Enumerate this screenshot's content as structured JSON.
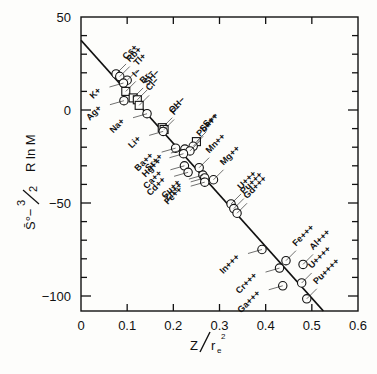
{
  "chart_data": {
    "type": "scatter",
    "title": "",
    "xlabel": "Z / r_e^2",
    "ylabel": "S° − 3/2 R ln M",
    "xlim": [
      0,
      0.6
    ],
    "ylim": [
      -110,
      50
    ],
    "x_ticks": [
      "0",
      "0.1",
      "0.2",
      "0.3",
      "0.4",
      "0.5",
      "0.6"
    ],
    "y_ticks": [
      "50",
      "0",
      "-50",
      "-100"
    ],
    "grid": false,
    "legend": "none",
    "markers": {
      "cation": "circle",
      "anion": "square"
    },
    "fit_line": {
      "x": [
        0,
        0.525
      ],
      "y": [
        37.5,
        -111
      ]
    },
    "points": [
      {
        "label": "Cs+",
        "x": 0.076,
        "y": 19.4,
        "marker": "circle"
      },
      {
        "label": "Rb+",
        "x": 0.084,
        "y": 18.0,
        "marker": "circle"
      },
      {
        "label": "Tl+",
        "x": 0.1,
        "y": 16.0,
        "marker": "circle"
      },
      {
        "label": "K+",
        "x": 0.092,
        "y": 14.5,
        "marker": "circle"
      },
      {
        "label": "I−",
        "x": 0.097,
        "y": 10.0,
        "marker": "square"
      },
      {
        "label": "Br−",
        "x": 0.113,
        "y": 6.5,
        "marker": "square"
      },
      {
        "label": "SH−",
        "x": 0.122,
        "y": 5.5,
        "marker": "square"
      },
      {
        "label": "Ag+",
        "x": 0.093,
        "y": 5.0,
        "marker": "circle"
      },
      {
        "label": "Cl−",
        "x": 0.126,
        "y": 2.5,
        "marker": "square"
      },
      {
        "label": "Na+",
        "x": 0.143,
        "y": -2.0,
        "marker": "circle"
      },
      {
        "label": "OH−",
        "x": 0.176,
        "y": -9.5,
        "marker": "square"
      },
      {
        "label": "F−",
        "x": 0.18,
        "y": -10.5,
        "marker": "square"
      },
      {
        "label": "Li+",
        "x": 0.178,
        "y": -11.5,
        "marker": "circle"
      },
      {
        "label": "S−−",
        "x": 0.25,
        "y": -17.0,
        "marker": "square"
      },
      {
        "label": "Sn++",
        "x": 0.243,
        "y": -19.5,
        "marker": "circle"
      },
      {
        "label": "Ba++",
        "x": 0.205,
        "y": -20.5,
        "marker": "circle"
      },
      {
        "label": "Sr++",
        "x": 0.225,
        "y": -21.0,
        "marker": "circle"
      },
      {
        "label": "Pb++",
        "x": 0.236,
        "y": -22.0,
        "marker": "circle"
      },
      {
        "label": "Hg++",
        "x": 0.222,
        "y": -23.5,
        "marker": "circle"
      },
      {
        "label": "Ca++",
        "x": 0.224,
        "y": -30.0,
        "marker": "circle"
      },
      {
        "label": "Mn++",
        "x": 0.256,
        "y": -31.0,
        "marker": "circle"
      },
      {
        "label": "Cd++",
        "x": 0.232,
        "y": -33.5,
        "marker": "circle"
      },
      {
        "label": "Cu++",
        "x": 0.264,
        "y": -35.0,
        "marker": "circle"
      },
      {
        "label": "Zn++",
        "x": 0.268,
        "y": -36.5,
        "marker": "circle"
      },
      {
        "label": "Mg++",
        "x": 0.287,
        "y": -37.5,
        "marker": "circle"
      },
      {
        "label": "Fe++",
        "x": 0.268,
        "y": -38.8,
        "marker": "circle"
      },
      {
        "label": "U+++",
        "x": 0.325,
        "y": -50.5,
        "marker": "circle"
      },
      {
        "label": "Pu+++",
        "x": 0.331,
        "y": -53.0,
        "marker": "circle"
      },
      {
        "label": "Gd+++",
        "x": 0.338,
        "y": -55.5,
        "marker": "circle"
      },
      {
        "label": "In+++",
        "x": 0.392,
        "y": -75.0,
        "marker": "circle"
      },
      {
        "label": "Fe+++",
        "x": 0.444,
        "y": -81.0,
        "marker": "circle"
      },
      {
        "label": "Al+++",
        "x": 0.481,
        "y": -83.0,
        "marker": "circle"
      },
      {
        "label": "Cr+++",
        "x": 0.43,
        "y": -85.0,
        "marker": "circle"
      },
      {
        "label": "U++++",
        "x": 0.478,
        "y": -93.0,
        "marker": "circle"
      },
      {
        "label": "Ga+++",
        "x": 0.437,
        "y": -94.5,
        "marker": "circle"
      },
      {
        "label": "Pu++++",
        "x": 0.489,
        "y": -101.5,
        "marker": "circle"
      }
    ]
  },
  "labels": {
    "x_axis_main": "Z",
    "x_axis_denominator": "r",
    "x_axis_subscript": "e",
    "x_axis_superscript": "2",
    "y_axis_part1": "S̄°−",
    "y_axis_fraction_num": "3",
    "y_axis_fraction_den": "2",
    "y_axis_part2": "R ln M"
  }
}
